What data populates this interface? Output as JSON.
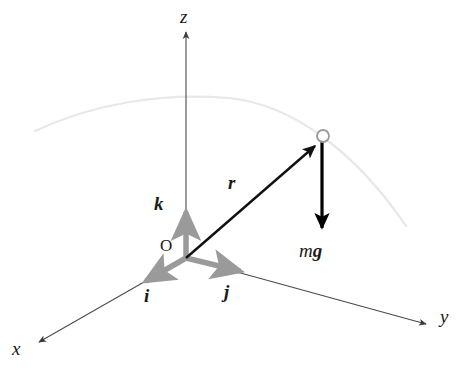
{
  "figure": {
    "background_color": "#ffffff",
    "width": 468,
    "height": 380
  },
  "colors": {
    "axis": "#4a4a4a",
    "unit_vector": "#8c8c8c",
    "position_vector": "#111111",
    "force_vector": "#000000",
    "trajectory": "#e8e8e8",
    "particle_stroke": "#9a9a9a",
    "particle_fill": "#ffffff",
    "label_text": "#1a1a1a"
  },
  "axes": [
    {
      "id": "x",
      "label": "x",
      "label_x": 14,
      "label_y": 349,
      "from": [
        186,
        258
      ],
      "to": [
        37,
        343
      ],
      "arrowhead": true,
      "description": "x-axis toward lower-left, out of page"
    },
    {
      "id": "y",
      "label": "y",
      "label_x": 440,
      "label_y": 317,
      "from": [
        186,
        258
      ],
      "to": [
        428,
        325
      ],
      "arrowhead": true,
      "description": "y-axis toward lower-right"
    },
    {
      "id": "z",
      "label": "z",
      "label_x": 180,
      "label_y": 8,
      "from": [
        186,
        258
      ],
      "to": [
        186,
        30
      ],
      "arrowhead": true,
      "description": "z-axis vertical, upward"
    }
  ],
  "origin": {
    "label": "O",
    "label_x": 161,
    "label_y": 238,
    "point": [
      186,
      258
    ]
  },
  "unit_vectors": [
    {
      "id": "i",
      "label": "i",
      "label_x": 145,
      "label_y": 288,
      "from": [
        186,
        258
      ],
      "to": [
        140,
        284
      ],
      "description": "unit vector along x"
    },
    {
      "id": "j",
      "label": "j",
      "label_x": 224,
      "label_y": 283,
      "from": [
        186,
        258
      ],
      "to": [
        246,
        273
      ],
      "description": "unit vector along y"
    },
    {
      "id": "k",
      "label": "k",
      "label_x": 155,
      "label_y": 197,
      "from": [
        186,
        258
      ],
      "to": [
        186,
        208
      ],
      "description": "unit vector along z"
    }
  ],
  "position_vector": {
    "id": "r",
    "label": "r",
    "label_x": 228,
    "label_y": 177,
    "from": [
      186,
      258
    ],
    "to": [
      318,
      143
    ],
    "description": "position vector from origin to particle"
  },
  "force_vector": {
    "id": "mg",
    "label_m": "m",
    "label_g": "g",
    "label_x": 301,
    "label_y": 243,
    "from": [
      322,
      140
    ],
    "to": [
      322,
      233
    ],
    "description": "weight force mg acting downward on particle"
  },
  "particle": {
    "label": "",
    "center": [
      323,
      136
    ],
    "radius": 6,
    "description": "point mass on trajectory"
  },
  "trajectory": {
    "description": "faint parabolic flight path of the particle",
    "path": "M 35,131 C 90,105 160,92 228,98 C 296,104 360,158 406,226",
    "stroke_width": 2.2
  }
}
